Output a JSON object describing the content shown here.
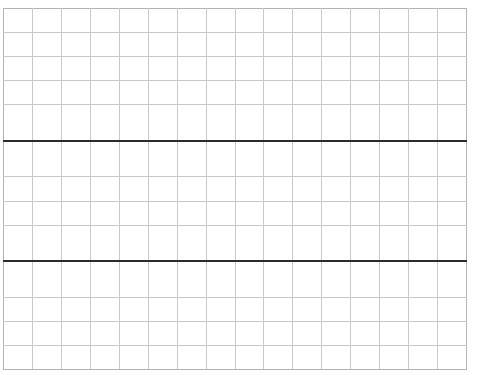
{
  "page": {
    "kind": "blank-grid-worksheet",
    "background_color": "#ffffff",
    "grid_line_color": "#c9c9c9",
    "frame_line_color": "#b4b4b4",
    "rule_line_color": "#2b2b2b"
  },
  "clipped_header": {
    "note": "text clipped by top edge of screenshot; only lowest pixel rows of glyphs visible",
    "cells": [
      "",
      ""
    ]
  },
  "grid": {
    "columns": 16,
    "rows": 13,
    "cell_width_px": 29,
    "cell_height_px": 28,
    "heavy_rule_after_rows": [
      4,
      8
    ],
    "cells": [
      [
        "",
        "",
        "",
        "",
        "",
        "",
        "",
        "",
        "",
        "",
        "",
        "",
        "",
        "",
        "",
        ""
      ],
      [
        "",
        "",
        "",
        "",
        "",
        "",
        "",
        "",
        "",
        "",
        "",
        "",
        "",
        "",
        "",
        ""
      ],
      [
        "",
        "",
        "",
        "",
        "",
        "",
        "",
        "",
        "",
        "",
        "",
        "",
        "",
        "",
        "",
        ""
      ],
      [
        "",
        "",
        "",
        "",
        "",
        "",
        "",
        "",
        "",
        "",
        "",
        "",
        "",
        "",
        "",
        ""
      ],
      [
        "",
        "",
        "",
        "",
        "",
        "",
        "",
        "",
        "",
        "",
        "",
        "",
        "",
        "",
        "",
        ""
      ],
      [
        "",
        "",
        "",
        "",
        "",
        "",
        "",
        "",
        "",
        "",
        "",
        "",
        "",
        "",
        "",
        ""
      ],
      [
        "",
        "",
        "",
        "",
        "",
        "",
        "",
        "",
        "",
        "",
        "",
        "",
        "",
        "",
        "",
        ""
      ],
      [
        "",
        "",
        "",
        "",
        "",
        "",
        "",
        "",
        "",
        "",
        "",
        "",
        "",
        "",
        "",
        ""
      ],
      [
        "",
        "",
        "",
        "",
        "",
        "",
        "",
        "",
        "",
        "",
        "",
        "",
        "",
        "",
        "",
        ""
      ],
      [
        "",
        "",
        "",
        "",
        "",
        "",
        "",
        "",
        "",
        "",
        "",
        "",
        "",
        "",
        "",
        ""
      ],
      [
        "",
        "",
        "",
        "",
        "",
        "",
        "",
        "",
        "",
        "",
        "",
        "",
        "",
        "",
        "",
        ""
      ],
      [
        "",
        "",
        "",
        "",
        "",
        "",
        "",
        "",
        "",
        "",
        "",
        "",
        "",
        "",
        "",
        ""
      ],
      [
        "",
        "",
        "",
        "",
        "",
        "",
        "",
        "",
        "",
        "",
        "",
        "",
        "",
        "",
        "",
        ""
      ]
    ]
  }
}
